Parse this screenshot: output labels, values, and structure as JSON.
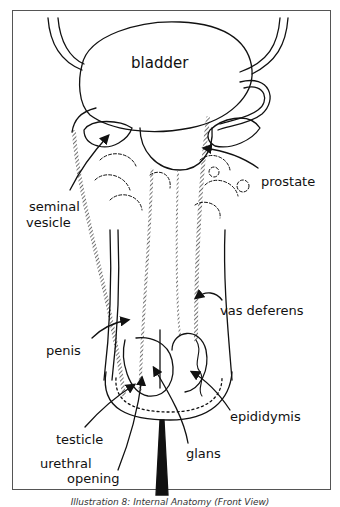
{
  "diagram": {
    "type": "anatomical line drawing",
    "labels": {
      "bladder": "bladder",
      "prostate": "prostate",
      "seminal_vesicle_line1": "seminal",
      "seminal_vesicle_line2": "vesicle",
      "vas_deferens": "vas deferens",
      "penis": "penis",
      "epididymis": "epididymis",
      "testicle": "testicle",
      "glans": "glans",
      "urethral_opening_line1": "urethral",
      "urethral_opening_line2": "opening"
    },
    "caption": "Illustration 8: Internal Anatomy (Front View)"
  }
}
